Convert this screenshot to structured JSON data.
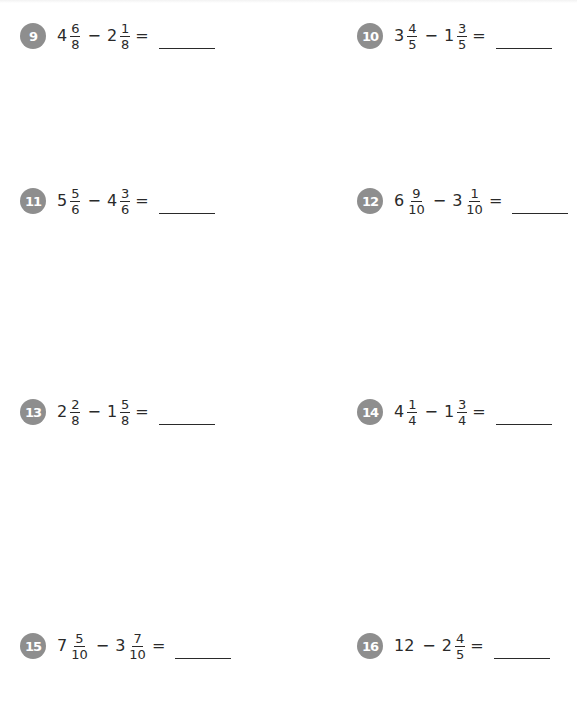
{
  "problems": [
    {
      "number": "9",
      "a_whole": "4",
      "a_num": "6",
      "a_den": "8",
      "operator": "−",
      "b_whole": "2",
      "b_num": "1",
      "b_den": "8",
      "equals": "=",
      "answer": ""
    },
    {
      "number": "10",
      "a_whole": "3",
      "a_num": "4",
      "a_den": "5",
      "operator": "−",
      "b_whole": "1",
      "b_num": "3",
      "b_den": "5",
      "equals": "=",
      "answer": ""
    },
    {
      "number": "11",
      "a_whole": "5",
      "a_num": "5",
      "a_den": "6",
      "operator": "−",
      "b_whole": "4",
      "b_num": "3",
      "b_den": "6",
      "equals": "=",
      "answer": ""
    },
    {
      "number": "12",
      "a_whole": "6",
      "a_num": "9",
      "a_den": "10",
      "operator": "−",
      "b_whole": "3",
      "b_num": "1",
      "b_den": "10",
      "equals": "=",
      "answer": ""
    },
    {
      "number": "13",
      "a_whole": "2",
      "a_num": "2",
      "a_den": "8",
      "operator": "−",
      "b_whole": "1",
      "b_num": "5",
      "b_den": "8",
      "equals": "=",
      "answer": ""
    },
    {
      "number": "14",
      "a_whole": "4",
      "a_num": "1",
      "a_den": "4",
      "operator": "−",
      "b_whole": "1",
      "b_num": "3",
      "b_den": "4",
      "equals": "=",
      "answer": ""
    },
    {
      "number": "15",
      "a_whole": "7",
      "a_num": "5",
      "a_den": "10",
      "operator": "−",
      "b_whole": "3",
      "b_num": "7",
      "b_den": "10",
      "equals": "=",
      "answer": ""
    },
    {
      "number": "16",
      "a_whole": "12",
      "operator": "−",
      "b_whole": "2",
      "b_num": "4",
      "b_den": "5",
      "equals": "=",
      "answer": ""
    }
  ],
  "colors": {
    "badge": "#8e8e8e",
    "text": "#2a2a2a",
    "background": "#ffffff"
  }
}
